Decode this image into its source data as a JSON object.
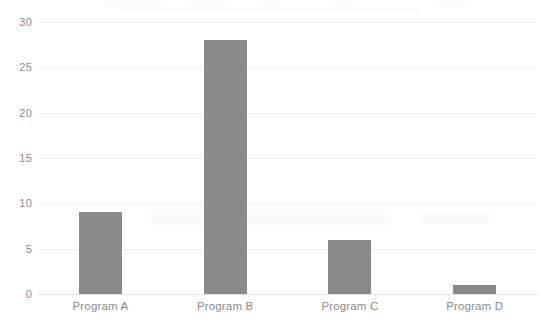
{
  "chart_data": {
    "type": "bar",
    "title": "",
    "xlabel": "",
    "ylabel": "",
    "categories": [
      "Program A",
      "Program B",
      "Program C",
      "Program D"
    ],
    "values": [
      9,
      28,
      6,
      1
    ],
    "ylim": [
      0,
      30
    ],
    "yticks": [
      0,
      5,
      10,
      15,
      20,
      25,
      30
    ],
    "ytick_labels": [
      "0",
      "5",
      "10",
      "15",
      "20",
      "25",
      "30"
    ],
    "grid": true,
    "legend": false,
    "legend_position": "none",
    "series": [
      {
        "name": "",
        "values": [
          9,
          28,
          6,
          1
        ]
      }
    ],
    "colors": {
      "bar": "#8a8a8a",
      "gridline": "#eeeeee",
      "axis": "#e2e2e2",
      "tick_text": "#8c8c8c",
      "background": "#ffffff"
    }
  }
}
